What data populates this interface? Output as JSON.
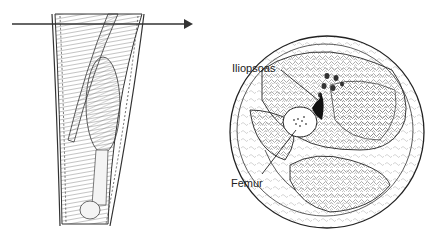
{
  "figure": {
    "type": "anatomical illustration",
    "left_panel": "anterior view of thigh musculature with horizontal section line",
    "right_panel": "cross-section of thigh",
    "labels": [
      {
        "text": "Iliopsoas",
        "x": 232,
        "y": 62
      },
      {
        "text": "Femur",
        "x": 231,
        "y": 177
      }
    ],
    "colors": {
      "line": "#222222",
      "background": "#ffffff",
      "bone": "#ffffff",
      "dark": "#111111"
    }
  }
}
